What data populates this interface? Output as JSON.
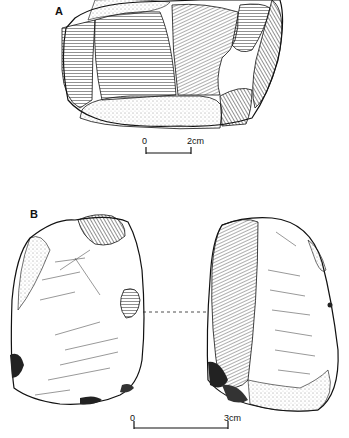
{
  "figure": {
    "panel_a": {
      "label": "A",
      "scale": {
        "start": "0",
        "end": "2cm"
      }
    },
    "panel_b": {
      "label": "B",
      "scale": {
        "start": "0",
        "end": "3cm"
      }
    }
  }
}
